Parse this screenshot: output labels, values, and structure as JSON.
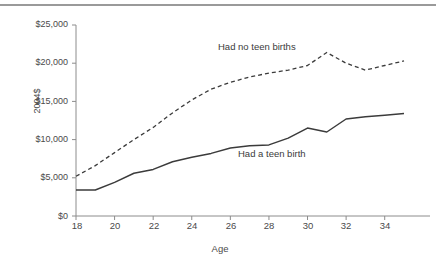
{
  "figure": {
    "rule_color": "#9a9a9a",
    "background": "#ffffff",
    "line_color": "#3b3b3b",
    "axis_color": "#8c8c8c"
  },
  "axes": {
    "y_title": "2004$",
    "x_title": "Age",
    "y_ticks": [
      "$0",
      "$5,000",
      "$10,000",
      "$15,000",
      "$20,000",
      "$25,000"
    ],
    "x_ticks": [
      "18",
      "20",
      "22",
      "24",
      "26",
      "28",
      "30",
      "32",
      "34"
    ]
  },
  "annotations": {
    "no_teen": "Had no teen births",
    "teen": "Had a teen birth"
  },
  "chart_data": {
    "type": "line",
    "title": "",
    "xlabel": "Age",
    "ylabel": "2004$",
    "xlim": [
      18,
      35
    ],
    "ylim": [
      0,
      25000
    ],
    "ytick_values": [
      0,
      5000,
      10000,
      15000,
      20000,
      25000
    ],
    "xtick_values": [
      18,
      20,
      22,
      24,
      26,
      28,
      30,
      32,
      34
    ],
    "grid": false,
    "legend": "inline-annotations",
    "x": [
      18,
      19,
      20,
      21,
      22,
      23,
      24,
      25,
      26,
      27,
      28,
      29,
      30,
      31,
      32,
      33,
      34,
      35
    ],
    "series": [
      {
        "name": "Had no teen births",
        "style": "dashed",
        "color": "#3b3b3b",
        "values": [
          5200,
          6600,
          8300,
          10000,
          11600,
          13500,
          15200,
          16600,
          17500,
          18200,
          18700,
          19100,
          19700,
          21400,
          20000,
          19100,
          19700,
          20300
        ]
      },
      {
        "name": "Had a teen birth",
        "style": "solid",
        "color": "#3b3b3b",
        "values": [
          3400,
          3400,
          4400,
          5600,
          6100,
          7100,
          7700,
          8200,
          8900,
          9200,
          9300,
          10200,
          11500,
          11000,
          12700,
          13000,
          13200,
          13400
        ]
      }
    ]
  }
}
